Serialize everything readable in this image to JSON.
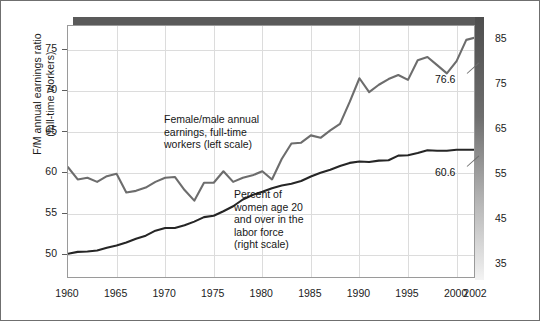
{
  "chart_data": {
    "type": "line",
    "title": "",
    "xlabel": "",
    "grid": true,
    "legend_position": "inline-annotations",
    "x": [
      1960,
      1961,
      1962,
      1963,
      1964,
      1965,
      1966,
      1967,
      1968,
      1969,
      1970,
      1971,
      1972,
      1973,
      1974,
      1975,
      1976,
      1977,
      1978,
      1979,
      1980,
      1981,
      1982,
      1983,
      1984,
      1985,
      1986,
      1987,
      1988,
      1989,
      1990,
      1991,
      1992,
      1993,
      1994,
      1995,
      1996,
      1997,
      1998,
      1999,
      2000,
      2001,
      2002
    ],
    "x_tick_labels": [
      "1960",
      "1965",
      "1970",
      "1975",
      "1980",
      "1985",
      "1990",
      "1995",
      "2000",
      "2002"
    ],
    "x_ticks": [
      1960,
      1965,
      1970,
      1975,
      1980,
      1985,
      1990,
      1995,
      2000,
      2002
    ],
    "xlim": [
      1960,
      2002
    ],
    "left_axis": {
      "label": "F/M annual earnings ratio\n(full-time workers)",
      "ticks": [
        50,
        55,
        60,
        65,
        70,
        75
      ],
      "tick_labels": [
        "50",
        "55",
        "60",
        "65",
        "70",
        "75"
      ],
      "lim": [
        47.0,
        78.0
      ]
    },
    "right_axis": {
      "label": "",
      "ticks": [
        35,
        45,
        55,
        65,
        75,
        85
      ],
      "tick_labels": [
        "35",
        "45",
        "55",
        "65",
        "75",
        "85"
      ],
      "lim": [
        32.0,
        88.0
      ]
    },
    "series": [
      {
        "name": "Female/male annual earnings, full-time workers (left scale)",
        "axis": "left",
        "color": "#6d6d6d",
        "annotation": "Female/male annual\nearnings, full-time\nworkers (left scale)",
        "end_label": "76.6",
        "values": [
          60.7,
          59.2,
          59.4,
          58.9,
          59.6,
          59.9,
          57.6,
          57.8,
          58.2,
          58.9,
          59.4,
          59.5,
          57.9,
          56.6,
          58.8,
          58.8,
          60.2,
          58.9,
          59.4,
          59.7,
          60.2,
          59.2,
          61.7,
          63.6,
          63.7,
          64.6,
          64.3,
          65.2,
          66.0,
          68.7,
          71.6,
          69.9,
          70.8,
          71.5,
          72.0,
          71.4,
          73.8,
          74.2,
          73.2,
          72.2,
          73.7,
          76.3,
          76.6
        ]
      },
      {
        "name": "Percent of women age 20 and over in the labor force (right scale)",
        "axis": "right",
        "color": "#262626",
        "annotation": "Percent of\nwomen age 20\nand over in the\nlabor force\n(right scale)",
        "end_label": "60.6",
        "values": [
          37.6,
          38.0,
          38.1,
          38.3,
          38.9,
          39.4,
          40.1,
          40.9,
          41.6,
          42.7,
          43.3,
          43.3,
          43.9,
          44.7,
          45.7,
          46.0,
          47.0,
          48.1,
          49.6,
          50.6,
          51.3,
          52.1,
          52.7,
          53.1,
          53.7,
          54.7,
          55.5,
          56.2,
          57.0,
          57.7,
          58.0,
          57.9,
          58.2,
          58.3,
          59.3,
          59.4,
          59.9,
          60.5,
          60.4,
          60.4,
          60.6,
          60.6,
          60.6
        ]
      }
    ]
  },
  "annotations": {
    "left_series_note": "Female/male annual\nearnings, full-time\nworkers (left scale)",
    "right_series_note": "Percent of\nwomen age 20\nand over in the\nlabor force\n(right scale)",
    "left_end_value": "76.6",
    "right_end_value": "60.6"
  },
  "colors": {
    "earnings_ratio_line": "#6d6d6d",
    "labor_force_line": "#262626",
    "gridline": "#dcdcdc",
    "frame": "#9a9a9a",
    "shadow": "#5a5a5a",
    "text": "#1b1b1b",
    "background": "#ffffff"
  }
}
